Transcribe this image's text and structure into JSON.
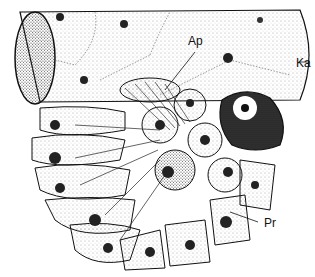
{
  "figure": {
    "type": "biological line illustration",
    "labels": [
      {
        "id": "ap",
        "text": "Ap"
      },
      {
        "id": "ka",
        "text": "Ka"
      },
      {
        "id": "pr",
        "text": "Pr"
      }
    ],
    "colors": {
      "ink": "#111111",
      "paper": "#ffffff",
      "stipple": "#444444"
    }
  }
}
